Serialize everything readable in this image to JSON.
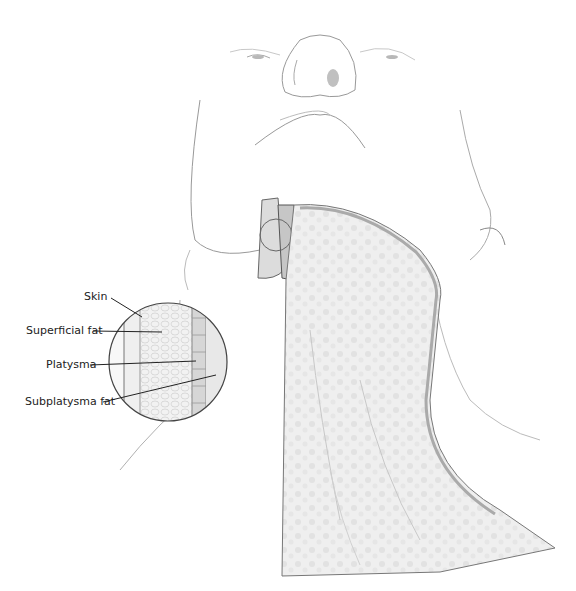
{
  "figure": {
    "labels": [
      {
        "id": "skin",
        "text": "Skin"
      },
      {
        "id": "superficial-fat",
        "text": "Superficial fat"
      },
      {
        "id": "platysma",
        "text": "Platysma"
      },
      {
        "id": "subplatysma-fat",
        "text": "Subplatysma fat"
      }
    ],
    "colors": {
      "line": "#333333",
      "sketch": "#9a9a9a",
      "tissue": "#e4e4e4",
      "shadow": "#c8c8c8"
    }
  }
}
